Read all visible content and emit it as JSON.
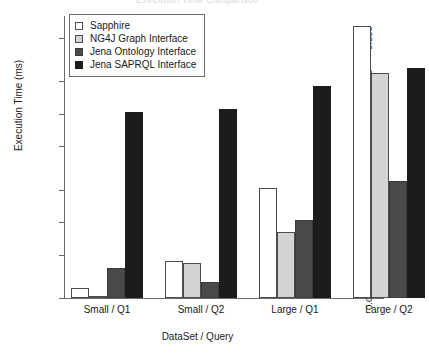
{
  "chart_data": {
    "type": "bar",
    "title": "Execution Time Comparison",
    "xlabel": "DataSet / Query",
    "ylabel": "Execution Time (ms)",
    "categories": [
      "Small / Q1",
      "Small / Q2",
      "Large / Q1",
      "Large / Q2"
    ],
    "yscale": "log",
    "ylim": [
      0.002,
      0.8
    ],
    "ytick_values": [
      0.002,
      0.005,
      0.01,
      0.02,
      0.05,
      0.1,
      0.2,
      0.5
    ],
    "ytick_labels": [
      "0.002",
      "0.005",
      "0.010",
      "0.020",
      "0.050",
      "0.100",
      "0.200",
      "0.500"
    ],
    "grid": false,
    "legend_position": "top-left",
    "series": [
      {
        "name": "Sapphire",
        "color": "#ffffff",
        "values": [
          0.0025,
          0.0044,
          0.0205,
          0.65
        ]
      },
      {
        "name": "NG4J Graph Interface",
        "color": "#d4d4d4",
        "values": [
          0.0021,
          0.0042,
          0.0082,
          0.24
        ]
      },
      {
        "name": "Jena Ontology Interface",
        "color": "#4a4a4a",
        "values": [
          0.0038,
          0.0028,
          0.0105,
          0.024
        ]
      },
      {
        "name": "Jena SAPRQL Interface",
        "color": "#1c1c1c",
        "values": [
          0.105,
          0.11,
          0.18,
          0.265
        ]
      }
    ]
  }
}
